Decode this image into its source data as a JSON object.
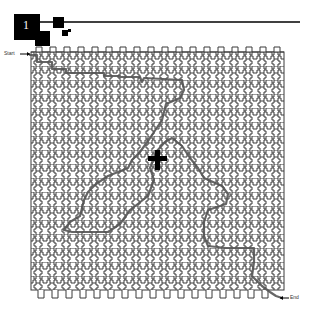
{
  "header": {
    "level_number": "1",
    "colors": {
      "ink": "#000000"
    }
  },
  "maze": {
    "start_label": "Start",
    "end_label": "End",
    "columns": 18,
    "rows": 17,
    "cell_size": 14,
    "origin": [
      31,
      52
    ],
    "colors": {
      "wall": "#3a3a3a",
      "path": "#555555",
      "background": "#ffffff",
      "player": "#000000"
    },
    "solution_path": "M 30 55 L 37 55 L 37 62 L 52 62 L 52 69 L 66 69 L 66 73 L 104 73 L 104 76 L 120 76 L 120 77 L 140 77 L 142 82 L 144 78 L 182 80 L 184 90 L 180 98 L 166 104 L 162 120 L 150 138 L 140 152 L 132 160 L 128 168 L 108 176 L 96 184 L 88 192 L 84 200 L 80 216 L 70 222 L 64 230 L 72 232 L 108 232 L 120 224 L 130 210 L 148 196 L 154 180 L 150 168 L 156 152 L 165 142 L 172 138 L 182 146 L 190 158 L 198 168 L 204 178 L 222 186 L 228 194 L 226 204 L 208 210 L 204 222 L 204 236 L 208 246 L 226 248 L 254 248 L 254 262 L 252 276 L 262 286 L 270 292 L 276 296 L 282 298",
    "player_marker": {
      "x": 158,
      "y": 160
    }
  }
}
